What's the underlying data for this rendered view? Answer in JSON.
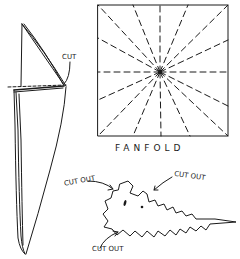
{
  "diagram": {
    "type": "hand-drawn paper folding / cutting instructions",
    "ink_color": "#1a1a1a",
    "background": "#ffffff",
    "folded_cone": {
      "label": "CUT"
    },
    "square": {
      "caption": "FANFOLD",
      "fold_lines": 16
    },
    "cutout_shape": {
      "labels": [
        "CUT OUT",
        "CUT OUT",
        "CUT OUT"
      ]
    }
  }
}
